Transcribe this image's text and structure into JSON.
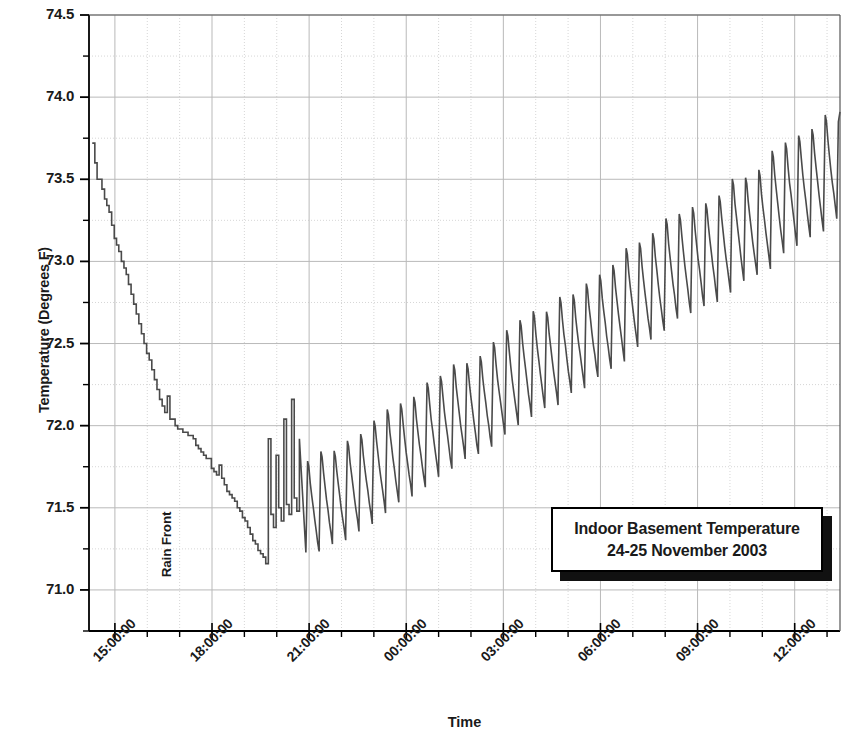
{
  "chart_data": {
    "type": "line",
    "title": "",
    "xlabel": "Time",
    "ylabel": "Temperature (Degrees F)",
    "ylim": [
      70.75,
      74.5
    ],
    "xlim": [
      14.2,
      37.4
    ],
    "grid": true,
    "y_major_ticks": [
      74.5,
      74.0,
      73.5,
      73.0,
      72.5,
      72.0,
      71.5,
      71.0
    ],
    "y_minor_step": 0.25,
    "x_major_ticks": [
      15,
      18,
      21,
      24,
      27,
      30,
      33,
      36
    ],
    "x_tick_labels": [
      "15:00:00",
      "18:00:00",
      "21:00:00",
      "00:00:00",
      "03:00:00",
      "06:00:00",
      "09:00:00",
      "12:00:00"
    ],
    "x_minor_step": 1,
    "series": [
      {
        "name": "Indoor Basement Temperature",
        "color": "#4a4a4a",
        "x": [
          14.3,
          14.38,
          14.45,
          14.52,
          14.6,
          14.68,
          14.75,
          14.82,
          14.9,
          14.98,
          15.05,
          15.12,
          15.2,
          15.28,
          15.35,
          15.42,
          15.5,
          15.58,
          15.66,
          15.74,
          15.82,
          15.9,
          15.98,
          16.06,
          16.14,
          16.22,
          16.3,
          16.38,
          16.46,
          16.54,
          16.62,
          16.7,
          16.78,
          16.86,
          16.94,
          17.02,
          17.1,
          17.18,
          17.26,
          17.34,
          17.42,
          17.5,
          17.58,
          17.66,
          17.74,
          17.82,
          17.9,
          17.98,
          18.06,
          18.14,
          18.22,
          18.3,
          18.38,
          18.46,
          18.54,
          18.62,
          18.7,
          18.78,
          18.86,
          18.94,
          19.02,
          19.1,
          19.18,
          19.26,
          19.34,
          19.42,
          19.5,
          19.58,
          19.66,
          19.74,
          19.82,
          19.9,
          19.98,
          20.06,
          20.14,
          20.22,
          20.3,
          20.38,
          20.46,
          20.54,
          20.62,
          20.7
        ],
        "y": [
          73.72,
          73.6,
          73.5,
          73.5,
          73.44,
          73.38,
          73.34,
          73.3,
          73.22,
          73.14,
          73.1,
          73.06,
          73.0,
          72.96,
          72.92,
          72.86,
          72.8,
          72.74,
          72.68,
          72.62,
          72.56,
          72.5,
          72.44,
          72.4,
          72.34,
          72.28,
          72.22,
          72.16,
          72.12,
          72.08,
          72.18,
          72.04,
          72.04,
          72.0,
          71.98,
          71.98,
          71.96,
          71.96,
          71.94,
          71.94,
          71.92,
          71.88,
          71.86,
          71.84,
          71.82,
          71.8,
          71.8,
          71.74,
          71.72,
          71.7,
          71.76,
          71.68,
          71.64,
          71.6,
          71.58,
          71.56,
          71.54,
          71.5,
          71.48,
          71.44,
          71.42,
          71.38,
          71.34,
          71.3,
          71.28,
          71.24,
          71.22,
          71.2,
          71.16,
          71.92,
          71.46,
          71.38,
          71.82,
          71.5,
          71.42,
          72.04,
          71.52,
          71.46,
          72.16,
          71.56,
          71.48,
          71.92
        ]
      }
    ],
    "annotations": [
      {
        "name": "rain-front",
        "text": "Rain Front",
        "x": 16.6,
        "rotation": 90
      }
    ],
    "legend": {
      "position": "bottom-right",
      "lines": [
        "Indoor Basement Temperature",
        "24-25 November 2003"
      ]
    },
    "oscillation": {
      "description": "Sawtooth cycles after rain front: temperature rises sharply then decays, with an overall warming trend",
      "start_x": 20.9,
      "end_x": 37.35,
      "period_hours": 0.41,
      "baseline_start": 71.45,
      "baseline_end": 73.55,
      "amplitude_start": 0.55,
      "amplitude_end": 0.62,
      "peaks_count": 40
    }
  },
  "axes": {
    "ylabel": "Temperature (Degrees F)",
    "xlabel": "Time",
    "ytick_labels": [
      "74.5",
      "74.0",
      "73.5",
      "73.0",
      "72.5",
      "72.0",
      "71.5",
      "71.0"
    ],
    "xtick_labels": [
      "15:00:00",
      "18:00:00",
      "21:00:00",
      "00:00:00",
      "03:00:00",
      "06:00:00",
      "09:00:00",
      "12:00:00"
    ]
  },
  "legend": {
    "line1": "Indoor Basement Temperature",
    "line2": "24-25 November 2003"
  },
  "annotation": {
    "rain_front": "Rain Front"
  },
  "colors": {
    "series": "#4a4a4a",
    "axis": "#000000",
    "grid_major": "#b9b9b9",
    "grid_minor": "#d6d6d6",
    "background": "#ffffff"
  }
}
